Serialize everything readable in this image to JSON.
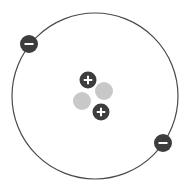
{
  "diagram": {
    "colors": {
      "background": "#ffffff",
      "orbit": "#4a4a4a",
      "charged_particle": "#3d3d3d",
      "symbol": "#ffffff",
      "neutron": "#c8c8c8"
    },
    "orbit": {
      "cx": 95,
      "cy": 96,
      "r": 83
    },
    "electrons": [
      {
        "cx": 29,
        "cy": 44,
        "r": 9,
        "symbol": "minus"
      },
      {
        "cx": 163,
        "cy": 143,
        "r": 9,
        "symbol": "minus"
      }
    ],
    "neutrons": [
      {
        "cx": 104,
        "cy": 91,
        "r": 9
      },
      {
        "cx": 82,
        "cy": 101,
        "r": 9
      }
    ],
    "protons": [
      {
        "cx": 88,
        "cy": 80,
        "r": 8.5,
        "symbol": "plus"
      },
      {
        "cx": 101,
        "cy": 112,
        "r": 8.5,
        "symbol": "plus"
      }
    ]
  }
}
